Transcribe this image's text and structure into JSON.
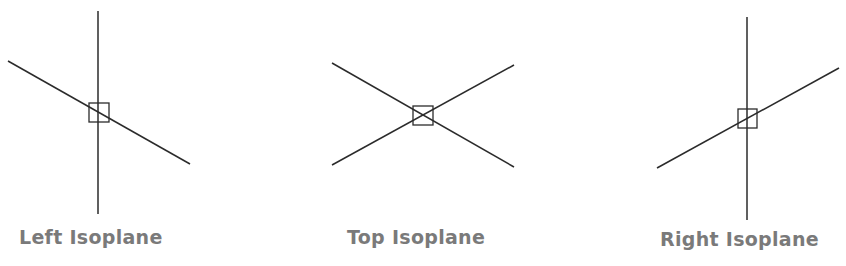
{
  "diagram": {
    "line_color": "#2b2b2b",
    "label_color": "#7a7a7a",
    "panels": [
      {
        "name": "left",
        "label": "Left Isoplane",
        "lines": [
          [
            98,
            11,
            98,
            214
          ],
          [
            8,
            61,
            190,
            164
          ]
        ],
        "box": [
          89,
          103,
          20,
          19
        ]
      },
      {
        "name": "top",
        "label": "Top Isoplane",
        "lines": [
          [
            332,
            63,
            514,
            167
          ],
          [
            332,
            165,
            514,
            65
          ]
        ],
        "box": [
          413,
          106,
          20,
          19
        ]
      },
      {
        "name": "right",
        "label": "Right Isoplane",
        "lines": [
          [
            747,
            17,
            747,
            220
          ],
          [
            657,
            168,
            839,
            68
          ]
        ],
        "box": [
          738,
          109,
          19,
          19
        ]
      }
    ]
  }
}
